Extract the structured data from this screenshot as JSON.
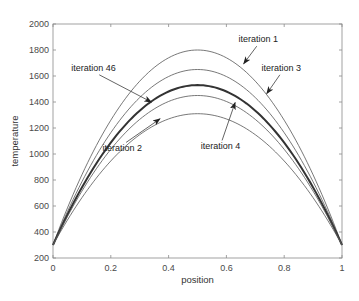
{
  "chart_data": {
    "type": "line",
    "title": "",
    "xlabel": "position",
    "ylabel": "temperature",
    "xlim": [
      0,
      1
    ],
    "ylim": [
      200,
      2000
    ],
    "xticks": [
      0,
      0.2,
      0.4,
      0.6,
      0.8,
      1
    ],
    "xtick_labels": [
      "0",
      "0.2",
      "0.4",
      "0.6",
      "0.8",
      "1"
    ],
    "yticks": [
      200,
      400,
      600,
      800,
      1000,
      1200,
      1400,
      1600,
      1800,
      2000
    ],
    "ytick_labels": [
      "200",
      "400",
      "600",
      "800",
      "1000",
      "1200",
      "1400",
      "1600",
      "1800",
      "2000"
    ],
    "grid": false,
    "legend": null,
    "x": [
      0,
      0.1,
      0.2,
      0.3,
      0.4,
      0.5,
      0.6,
      0.7,
      0.8,
      0.9,
      1.0
    ],
    "series": [
      {
        "name": "iteration 1",
        "boundary": 300,
        "peak": 1800,
        "values": [
          300,
          840,
          1260,
          1560,
          1740,
          1800,
          1740,
          1560,
          1260,
          840,
          300
        ],
        "line_width": 0.8,
        "color": "#555555"
      },
      {
        "name": "iteration 3",
        "boundary": 300,
        "peak": 1650,
        "values": [
          300,
          786,
          1164,
          1434,
          1596,
          1650,
          1596,
          1434,
          1164,
          786,
          300
        ],
        "line_width": 0.8,
        "color": "#555555"
      },
      {
        "name": "iteration 46",
        "boundary": 300,
        "peak": 1530,
        "values": [
          300,
          743,
          1087,
          1333,
          1481,
          1530,
          1481,
          1333,
          1087,
          743,
          300
        ],
        "line_width": 2.0,
        "color": "#333333"
      },
      {
        "name": "iteration 4",
        "boundary": 300,
        "peak": 1450,
        "values": [
          300,
          714,
          1036,
          1266,
          1404,
          1450,
          1404,
          1266,
          1036,
          714,
          300
        ],
        "line_width": 0.8,
        "color": "#555555"
      },
      {
        "name": "iteration 2",
        "boundary": 300,
        "peak": 1310,
        "values": [
          300,
          664,
          946,
          1148,
          1270,
          1310,
          1270,
          1148,
          946,
          664,
          300
        ],
        "line_width": 0.8,
        "color": "#555555"
      }
    ],
    "annotations": [
      {
        "text": "iteration 1",
        "text_pos": [
          0.71,
          1860
        ],
        "arrow_to": [
          0.66,
          1695
        ]
      },
      {
        "text": "iteration 3",
        "text_pos": [
          0.79,
          1640
        ],
        "arrow_to": [
          0.74,
          1465
        ]
      },
      {
        "text": "iteration 46",
        "text_pos": [
          0.14,
          1640
        ],
        "arrow_to": [
          0.34,
          1400
        ]
      },
      {
        "text": "iteration 4",
        "text_pos": [
          0.58,
          1035
        ],
        "arrow_to": [
          0.63,
          1395
        ]
      },
      {
        "text": "iteration 2",
        "text_pos": [
          0.24,
          1020
        ],
        "arrow_to": [
          0.37,
          1270
        ]
      }
    ]
  }
}
